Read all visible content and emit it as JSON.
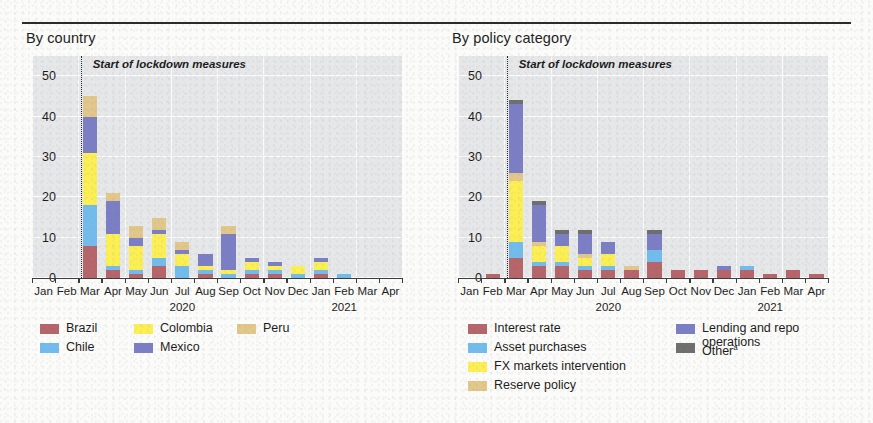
{
  "panels": [
    {
      "id": "by-country",
      "title": "By country",
      "annotation": "Start of lockdown measures",
      "legend": [
        {
          "label": "Brazil",
          "color": "#b5656a",
          "col": 0,
          "row": 0
        },
        {
          "label": "Chile",
          "color": "#72bced",
          "col": 0,
          "row": 1
        },
        {
          "label": "Colombia",
          "color": "#fcef53",
          "col": 1,
          "row": 0
        },
        {
          "label": "Mexico",
          "color": "#7b7ec4",
          "col": 1,
          "row": 1
        },
        {
          "label": "Peru",
          "color": "#e2c78b",
          "col": 2,
          "row": 0
        }
      ]
    },
    {
      "id": "by-policy-category",
      "title": "By policy category",
      "annotation": "Start of lockdown measures",
      "legend": [
        {
          "label": "Interest rate",
          "color": "#b5656a",
          "col": 0,
          "row": 0
        },
        {
          "label": "Asset purchases",
          "color": "#72bced",
          "col": 0,
          "row": 1
        },
        {
          "label": "FX markets intervention",
          "color": "#fcef53",
          "col": 0,
          "row": 2
        },
        {
          "label": "Reserve policy",
          "color": "#e2c78b",
          "col": 0,
          "row": 3
        },
        {
          "label": "Lending and repo operations",
          "color": "#7b7ec4",
          "col": 1,
          "row": 0
        },
        {
          "label": "Other",
          "color": "#6e6e6e",
          "col": 1,
          "row": 1,
          "superscript": "a"
        }
      ]
    }
  ],
  "chart_data": [
    {
      "type": "bar",
      "title": "By country",
      "stacked": true,
      "xlabel": "",
      "ylabel": "",
      "ylim": [
        0,
        55
      ],
      "yticks": [
        0,
        10,
        20,
        30,
        40,
        50
      ],
      "grid": true,
      "legend_position": "below",
      "categories": [
        "Jan",
        "Feb",
        "Mar",
        "Apr",
        "May",
        "Jun",
        "Jul",
        "Aug",
        "Sep",
        "Oct",
        "Nov",
        "Dec",
        "Jan",
        "Feb",
        "Mar",
        "Apr"
      ],
      "year_labels": [
        {
          "text": "2020",
          "at_index": 6
        },
        {
          "text": "2021",
          "at_index": 13
        }
      ],
      "annotations": [
        {
          "text": "Start of lockdown measures",
          "at_index": 2,
          "type": "vline-dotted"
        }
      ],
      "series": [
        {
          "name": "Brazil",
          "color": "#b5656a",
          "values": [
            0,
            0,
            8,
            2,
            1,
            3,
            0,
            1,
            0,
            1,
            1,
            0,
            1,
            0,
            0,
            0
          ]
        },
        {
          "name": "Chile",
          "color": "#72bced",
          "values": [
            0,
            0,
            10,
            1,
            1,
            2,
            3,
            1,
            1,
            1,
            1,
            1,
            1,
            1,
            0,
            0
          ]
        },
        {
          "name": "Colombia",
          "color": "#fcef53",
          "values": [
            0,
            0,
            13,
            8,
            6,
            6,
            3,
            1,
            1,
            2,
            1,
            2,
            2,
            0,
            0,
            0
          ]
        },
        {
          "name": "Mexico",
          "color": "#7b7ec4",
          "values": [
            0,
            0,
            9,
            8,
            2,
            1,
            1,
            3,
            9,
            1,
            1,
            0,
            1,
            0,
            0,
            0
          ]
        },
        {
          "name": "Peru",
          "color": "#e2c78b",
          "values": [
            0,
            0,
            5,
            2,
            3,
            3,
            2,
            0,
            2,
            0,
            0,
            0,
            0,
            0,
            0,
            0
          ]
        }
      ]
    },
    {
      "type": "bar",
      "title": "By policy category",
      "stacked": true,
      "xlabel": "",
      "ylabel": "",
      "ylim": [
        0,
        55
      ],
      "yticks": [
        0,
        10,
        20,
        30,
        40,
        50
      ],
      "grid": true,
      "legend_position": "below",
      "categories": [
        "Jan",
        "Feb",
        "Mar",
        "Apr",
        "May",
        "Jun",
        "Jul",
        "Aug",
        "Sep",
        "Oct",
        "Nov",
        "Dec",
        "Jan",
        "Feb",
        "Mar",
        "Apr"
      ],
      "year_labels": [
        {
          "text": "2020",
          "at_index": 6
        },
        {
          "text": "2021",
          "at_index": 13
        }
      ],
      "annotations": [
        {
          "text": "Start of lockdown measures",
          "at_index": 2,
          "type": "vline-dotted"
        }
      ],
      "series": [
        {
          "name": "Interest rate",
          "color": "#b5656a",
          "values": [
            0,
            1,
            5,
            3,
            3,
            2,
            2,
            2,
            4,
            2,
            2,
            2,
            2,
            1,
            2,
            1
          ]
        },
        {
          "name": "Asset purchases",
          "color": "#72bced",
          "values": [
            0,
            0,
            4,
            1,
            1,
            1,
            1,
            0,
            3,
            0,
            0,
            0,
            1,
            0,
            0,
            0
          ]
        },
        {
          "name": "FX markets intervention",
          "color": "#fcef53",
          "values": [
            0,
            0,
            15,
            4,
            4,
            2,
            3,
            0,
            0,
            0,
            0,
            0,
            0,
            0,
            0,
            0
          ]
        },
        {
          "name": "Reserve policy",
          "color": "#e2c78b",
          "values": [
            0,
            0,
            2,
            1,
            0,
            1,
            0,
            1,
            0,
            0,
            0,
            0,
            0,
            0,
            0,
            0
          ]
        },
        {
          "name": "Lending and repo operations",
          "color": "#7b7ec4",
          "values": [
            0,
            0,
            17,
            9,
            3,
            5,
            3,
            0,
            4,
            0,
            0,
            1,
            0,
            0,
            0,
            0
          ]
        },
        {
          "name": "Other",
          "color": "#6e6e6e",
          "values": [
            0,
            0,
            1,
            1,
            1,
            1,
            0,
            0,
            1,
            0,
            0,
            0,
            0,
            0,
            0,
            0
          ]
        }
      ]
    }
  ]
}
